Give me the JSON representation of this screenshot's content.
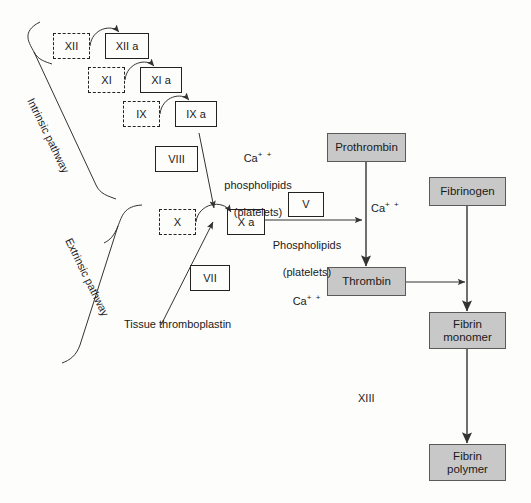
{
  "diagram": {
    "colors": {
      "gray_box_fill": "#c8c8c8",
      "gray_box_stroke": "#5a5a5a",
      "line": "#333333",
      "text": "#1a1a1a",
      "background": "#fdfdfc"
    },
    "pathway_labels": {
      "intrinsic": "Intrinsic pathway",
      "extrinsic": "Extrinsic pathway"
    },
    "factor_boxes": [
      {
        "id": "xii",
        "label": "XII",
        "style": "dashed"
      },
      {
        "id": "xii-a",
        "label": "XII a",
        "style": "solid"
      },
      {
        "id": "xi",
        "label": "XI",
        "style": "dashed"
      },
      {
        "id": "xi-a",
        "label": "XI a",
        "style": "solid"
      },
      {
        "id": "ix",
        "label": "IX",
        "style": "dashed"
      },
      {
        "id": "ix-a",
        "label": "IX a",
        "style": "solid"
      },
      {
        "id": "viii",
        "label": "VIII",
        "style": "solid"
      },
      {
        "id": "x",
        "label": "X",
        "style": "dashed"
      },
      {
        "id": "x-a",
        "label": "X a",
        "style": "solid"
      },
      {
        "id": "v",
        "label": "V",
        "style": "solid"
      },
      {
        "id": "vii",
        "label": "VII",
        "style": "solid"
      }
    ],
    "product_boxes": [
      {
        "id": "prothrombin",
        "label": "Prothrombin"
      },
      {
        "id": "thrombin",
        "label": "Thrombin"
      },
      {
        "id": "fibrinogen",
        "label": "Fibrinogen"
      },
      {
        "id": "fibrin-monomer",
        "label": "Fibrin\nmonomer"
      },
      {
        "id": "fibrin-polymer",
        "label": "Fibrin\npolymer"
      }
    ],
    "cofactor_notes": {
      "ix_to_x": {
        "line1_base": "Ca",
        "line1_sup": "+ +",
        "line2": "phospholipids",
        "line3": "(platelets)"
      },
      "xa_to_thrombin": {
        "line1": "Phospholipids",
        "line2": "(platelets)",
        "line3_base": "Ca",
        "line3_sup": "+ +"
      },
      "prothrombin_to_thrombin": {
        "base": "Ca",
        "sup": "+ +"
      }
    },
    "tissue_thromboplastin": "Tissue thromboplastin",
    "factor_xiii_label": "XIII"
  }
}
